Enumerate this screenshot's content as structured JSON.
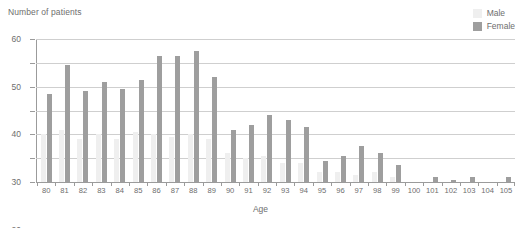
{
  "chart_data": {
    "type": "bar",
    "title": "",
    "ylabel": "Number of patients",
    "xlabel": "Age",
    "ylim": [
      0,
      60
    ],
    "yticks": [
      0,
      10,
      20,
      30,
      40,
      50,
      60
    ],
    "grid": true,
    "legend_position": "top-right",
    "categories": [
      "80",
      "81",
      "82",
      "83",
      "84",
      "85",
      "86",
      "87",
      "88",
      "89",
      "90",
      "91",
      "92",
      "93",
      "94",
      "95",
      "96",
      "97",
      "98",
      "99",
      "100",
      "101",
      "102",
      "103",
      "104",
      "105"
    ],
    "series": [
      {
        "name": "Male",
        "color": "#efefef",
        "values": [
          20,
          22,
          18,
          20,
          18,
          21,
          20,
          19,
          20,
          18,
          12,
          10,
          11,
          8,
          8,
          4,
          4,
          3,
          4,
          2,
          0,
          0,
          0,
          0,
          0,
          0
        ]
      },
      {
        "name": "Female",
        "color": "#9e9e9e",
        "values": [
          37,
          49,
          38,
          42,
          39,
          43,
          53,
          53,
          55,
          44,
          22,
          24,
          28,
          26,
          23,
          9,
          11,
          15,
          12,
          7,
          0,
          2,
          1,
          2,
          0,
          2
        ]
      }
    ]
  },
  "axis": {
    "y_title": "Number of patients",
    "x_title": "Age"
  },
  "legend": {
    "items": [
      {
        "label": "Male",
        "color": "#efefef"
      },
      {
        "label": "Female",
        "color": "#9e9e9e"
      }
    ]
  }
}
